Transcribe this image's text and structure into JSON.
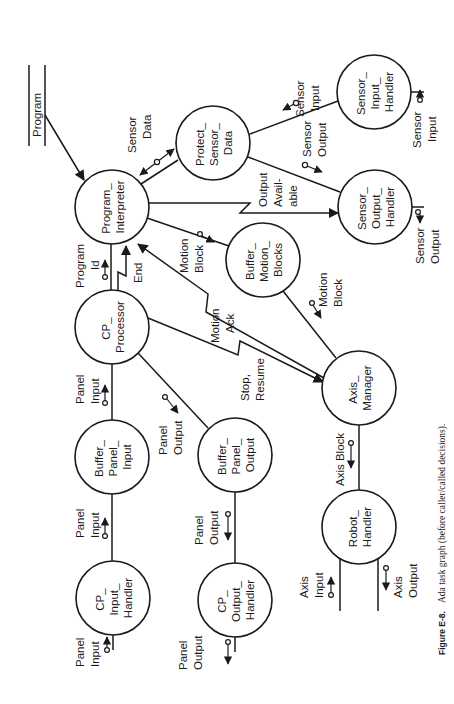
{
  "figure": {
    "caption_label": "Figure E-8.",
    "caption_text": "Ada task graph (before caller/called decisions)."
  },
  "data_store": {
    "program": "Program"
  },
  "nodes": {
    "program_interpreter": [
      "Program_",
      "Interpreter"
    ],
    "protect_sensor_data": [
      "Protect_",
      "Sensor_",
      "Data"
    ],
    "sensor_input_handler": [
      "Sensor_",
      "Input_",
      "Handler"
    ],
    "sensor_output_handler": [
      "Sensor_",
      "Output_",
      "Handler"
    ],
    "buffer_motion_blocks": [
      "Buffer_",
      "Motion_",
      "Blocks"
    ],
    "cp_processor": [
      "CP_",
      "Processor"
    ],
    "axis_manager": [
      "Axis_",
      "Manager"
    ],
    "buffer_panel_input": [
      "Buffer_",
      "Panel_",
      "Input"
    ],
    "buffer_panel_output": [
      "Buffer_",
      "Panel_",
      "Output"
    ],
    "robot_handler": [
      "Robot_",
      "Handler"
    ],
    "cp_input_handler": [
      "CP_",
      "Input_",
      "Handler"
    ],
    "cp_output_handler": [
      "CP_",
      "Output_",
      "Handler"
    ]
  },
  "flows": {
    "sensor_data": [
      "Sensor",
      "Data"
    ],
    "sensor_input_top": [
      "Sensor",
      "Input"
    ],
    "sensor_output_mid": [
      "Sensor",
      "Output"
    ],
    "output_available": [
      "Output",
      "Avail-",
      "able"
    ],
    "sensor_input_ext": [
      "Sensor",
      "Input"
    ],
    "sensor_output_ext": [
      "Sensor",
      "Output"
    ],
    "program_id": [
      "Program",
      "Id"
    ],
    "end": [
      "End"
    ],
    "motion_block_pi": [
      "Motion",
      "Block"
    ],
    "motion_ack": [
      "Motion",
      "Ack"
    ],
    "motion_block_am": [
      "Motion",
      "Block"
    ],
    "stop_resume": [
      "Stop,",
      "Resume"
    ],
    "panel_input_cp": [
      "Panel",
      "Input"
    ],
    "panel_output_cp": [
      "Panel",
      "Output"
    ],
    "axis_block": [
      "Axis Block"
    ],
    "panel_input_bpi": [
      "Panel",
      "Input"
    ],
    "panel_output_bpo": [
      "Panel",
      "Output"
    ],
    "axis_input": [
      "Axis",
      "Input"
    ],
    "axis_output": [
      "Axis",
      "Output"
    ],
    "panel_input_ext": [
      "Panel",
      "Input"
    ],
    "panel_output_ext": [
      "Panel",
      "Output"
    ]
  }
}
